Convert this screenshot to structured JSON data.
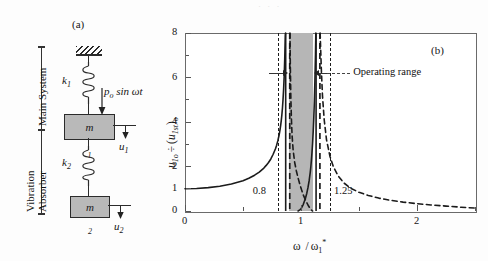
{
  "figure": {
    "panel_a_tag": "(a)",
    "panel_b_tag": "(b)",
    "ghost_top": "· · ·"
  },
  "diagram": {
    "bracket_main": "Main System",
    "bracket_absorber_line1": "Vibration",
    "bracket_absorber_line2": "Absorber",
    "spring1_label": "k",
    "spring1_sub": "1",
    "spring2_label": "k",
    "spring2_sub": "2",
    "mass1_label": "m",
    "mass1_sub": "1",
    "mass2_label": "m",
    "mass2_sub": "2",
    "disp1_label": "u",
    "disp1_sub": "1",
    "disp2_label": "u",
    "disp2_sub": "2",
    "force_p": "p",
    "force_p_sub": "o",
    "force_rest": " sin ωt",
    "ground_icon": "hatched-ground-icon"
  },
  "chart_data": {
    "type": "line",
    "title": "",
    "xlabel": "ω / ω₁*",
    "xlabel_parts": {
      "omega": "ω",
      "slash": "/",
      "omega_star": "ω",
      "sub": "1",
      "sup": "*"
    },
    "ylabel": "u₁ₒ ÷ (u₁ₛₜ)ₒ",
    "ylabel_parts": {
      "u": "u",
      "u_sub": "1o",
      "div": "÷",
      "open": "(",
      "u2": "u",
      "u2_sub": "1st",
      "close": ")",
      "close_sub": "o"
    },
    "xlim": [
      0,
      2.5
    ],
    "ylim": [
      0,
      8
    ],
    "xticks_major": [
      0,
      1,
      2
    ],
    "xticks_major_labels": [
      "0",
      "1",
      "2"
    ],
    "xticks_minor": [
      0.5,
      1.5,
      2.5
    ],
    "yticks_major": [
      0,
      1,
      2,
      4,
      6,
      8
    ],
    "yticks_major_labels": [
      "0",
      "1",
      "2",
      "4",
      "6",
      "8"
    ],
    "yticks_minor": [
      3,
      5,
      7
    ],
    "grid": false,
    "legend": "none",
    "operating_band": {
      "x_start": 0.9,
      "x_end": 1.1,
      "color": "#b6b6b6"
    },
    "marker_lines": [
      {
        "x": 0.8,
        "label": "0.8",
        "style": "dashed"
      },
      {
        "x": 1.25,
        "label": "1.25",
        "style": "dashed"
      }
    ],
    "annotations": [
      {
        "text": "Operating range",
        "x": 1.45,
        "y": 6.2
      }
    ],
    "series": [
      {
        "name": "main-mass-response-solid",
        "style": "solid",
        "points": [
          [
            0.0,
            1.0
          ],
          [
            0.1,
            1.01
          ],
          [
            0.2,
            1.05
          ],
          [
            0.3,
            1.11
          ],
          [
            0.4,
            1.21
          ],
          [
            0.5,
            1.36
          ],
          [
            0.55,
            1.47
          ],
          [
            0.6,
            1.61
          ],
          [
            0.64,
            1.75
          ],
          [
            0.68,
            1.93
          ],
          [
            0.7,
            2.05
          ],
          [
            0.72,
            2.18
          ],
          [
            0.74,
            2.34
          ],
          [
            0.76,
            2.55
          ],
          [
            0.78,
            2.8
          ],
          [
            0.79,
            2.96
          ],
          [
            0.8,
            3.15
          ],
          [
            0.81,
            3.38
          ],
          [
            0.815,
            3.52
          ],
          [
            0.82,
            3.68
          ],
          [
            0.825,
            3.86
          ],
          [
            0.83,
            4.07
          ],
          [
            0.835,
            4.32
          ],
          [
            0.84,
            4.62
          ],
          [
            0.845,
            5.0
          ],
          [
            0.85,
            5.46
          ],
          [
            0.855,
            6.05
          ],
          [
            0.86,
            6.85
          ],
          [
            0.865,
            7.9
          ],
          [
            0.867,
            8.0
          ]
        ]
      },
      {
        "name": "main-mass-response-solid-mid",
        "style": "solid",
        "points": [
          [
            0.975,
            0.0
          ],
          [
            0.99,
            0.05
          ],
          [
            1.0,
            0.1
          ],
          [
            1.02,
            0.3
          ],
          [
            1.04,
            0.6
          ],
          [
            1.05,
            0.8
          ],
          [
            1.06,
            1.05
          ],
          [
            1.07,
            1.35
          ],
          [
            1.08,
            1.75
          ],
          [
            1.085,
            2.0
          ],
          [
            1.09,
            2.3
          ],
          [
            1.095,
            2.65
          ],
          [
            1.1,
            3.05
          ],
          [
            1.105,
            3.55
          ],
          [
            1.11,
            4.15
          ],
          [
            1.115,
            4.9
          ],
          [
            1.12,
            5.85
          ],
          [
            1.125,
            7.05
          ],
          [
            1.128,
            8.0
          ]
        ]
      },
      {
        "name": "absorber-response-dashed-left",
        "style": "dashed",
        "points": [
          [
            0.905,
            8.0
          ],
          [
            0.908,
            6.5
          ],
          [
            0.912,
            5.2
          ],
          [
            0.917,
            4.2
          ],
          [
            0.923,
            3.4
          ],
          [
            0.932,
            2.75
          ],
          [
            0.945,
            2.2
          ],
          [
            0.96,
            1.8
          ],
          [
            0.975,
            1.48
          ],
          [
            0.99,
            1.2
          ],
          [
            1.005,
            0.95
          ],
          [
            1.02,
            0.72
          ],
          [
            1.04,
            0.48
          ],
          [
            1.06,
            0.27
          ],
          [
            1.08,
            0.1
          ],
          [
            1.095,
            0.02
          ],
          [
            1.1,
            0.0
          ]
        ]
      },
      {
        "name": "absorber-response-dashed-right",
        "style": "dashed",
        "points": [
          [
            1.165,
            8.0
          ],
          [
            1.175,
            6.4
          ],
          [
            1.185,
            5.2
          ],
          [
            1.2,
            4.1
          ],
          [
            1.22,
            3.2
          ],
          [
            1.25,
            2.45
          ],
          [
            1.28,
            1.98
          ],
          [
            1.32,
            1.58
          ],
          [
            1.37,
            1.26
          ],
          [
            1.43,
            1.02
          ],
          [
            1.5,
            0.84
          ],
          [
            1.58,
            0.7
          ],
          [
            1.67,
            0.58
          ],
          [
            1.77,
            0.48
          ],
          [
            1.88,
            0.4
          ],
          [
            2.0,
            0.33
          ],
          [
            2.12,
            0.27
          ],
          [
            2.25,
            0.22
          ],
          [
            2.38,
            0.17
          ],
          [
            2.5,
            0.13
          ]
        ]
      }
    ],
    "asymptotes": [
      {
        "name": "solid-asymptote-left",
        "x": 0.868,
        "style": "solid"
      },
      {
        "name": "dashed-asymptote-left",
        "x": 0.903,
        "style": "dashed"
      },
      {
        "name": "solid-asymptote-right",
        "x": 1.13,
        "style": "solid"
      },
      {
        "name": "dashed-asymptote-right",
        "x": 1.163,
        "style": "dashed"
      }
    ]
  }
}
